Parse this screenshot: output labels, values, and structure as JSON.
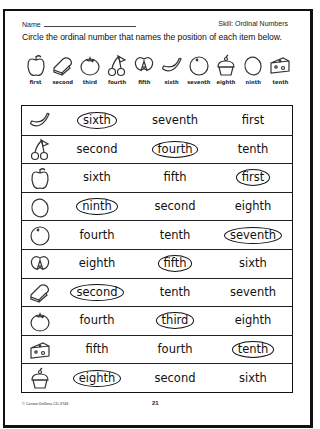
{
  "header": {
    "name_label": "Name",
    "skill_label": "Skill:  Ordinal Numbers",
    "instructions": "Circle the ordinal number that names the position of each item below."
  },
  "legend": [
    {
      "icon": "apple-icon",
      "label": "first"
    },
    {
      "icon": "bread-icon",
      "label": "second"
    },
    {
      "icon": "tomato-icon",
      "label": "third"
    },
    {
      "icon": "cherries-icon",
      "label": "fourth"
    },
    {
      "icon": "pretzel-icon",
      "label": "fifth"
    },
    {
      "icon": "banana-icon",
      "label": "sixth"
    },
    {
      "icon": "orange-icon",
      "label": "seventh"
    },
    {
      "icon": "cupcake-icon",
      "label": "eighth"
    },
    {
      "icon": "egg-icon",
      "label": "ninth"
    },
    {
      "icon": "cheese-icon",
      "label": "tenth"
    }
  ],
  "rows": [
    {
      "icon": "banana-icon",
      "options": [
        "sixth",
        "seventh",
        "first"
      ],
      "circled": 0
    },
    {
      "icon": "cherries-icon",
      "options": [
        "second",
        "fourth",
        "tenth"
      ],
      "circled": 1
    },
    {
      "icon": "apple-icon",
      "options": [
        "sixth",
        "fifth",
        "first"
      ],
      "circled": 2
    },
    {
      "icon": "egg-icon",
      "options": [
        "ninth",
        "second",
        "eighth"
      ],
      "circled": 0
    },
    {
      "icon": "orange-icon",
      "options": [
        "fourth",
        "tenth",
        "seventh"
      ],
      "circled": 2
    },
    {
      "icon": "pretzel-icon",
      "options": [
        "eighth",
        "fifth",
        "sixth"
      ],
      "circled": 1
    },
    {
      "icon": "bread-icon",
      "options": [
        "second",
        "tenth",
        "seventh"
      ],
      "circled": 0
    },
    {
      "icon": "tomato-icon",
      "options": [
        "fourth",
        "third",
        "eighth"
      ],
      "circled": 1
    },
    {
      "icon": "cheese-icon",
      "options": [
        "fifth",
        "fourth",
        "tenth"
      ],
      "circled": 2
    },
    {
      "icon": "cupcake-icon",
      "options": [
        "eighth",
        "second",
        "sixth"
      ],
      "circled": 0
    }
  ],
  "footer": {
    "copyright": "© Carson-Dellosa CD-3746",
    "page_number": "21"
  }
}
